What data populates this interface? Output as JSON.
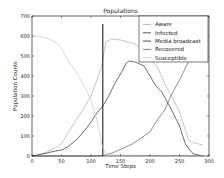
{
  "chart_data": {
    "type": "line",
    "title": "Populations",
    "xlabel": "Time Steps",
    "ylabel": "Population Counts",
    "xlim": [
      0,
      300
    ],
    "ylim": [
      0,
      700
    ],
    "xticks": [
      0,
      50,
      100,
      150,
      200,
      250,
      300
    ],
    "yticks": [
      0,
      100,
      200,
      300,
      400,
      500,
      600,
      700
    ],
    "grid": false,
    "legend_position": "upper right",
    "series": [
      {
        "name": "Aware",
        "color": "#b0b0b0",
        "x": [
          0,
          10,
          25,
          40,
          50,
          60,
          75,
          90,
          100,
          110,
          118,
          125,
          135,
          150,
          175,
          200,
          215,
          225,
          240,
          250,
          260,
          265,
          275,
          290
        ],
        "y": [
          0,
          5,
          20,
          40,
          60,
          110,
          180,
          250,
          300,
          380,
          450,
          570,
          585,
          580,
          560,
          500,
          430,
          360,
          280,
          220,
          130,
          80,
          65,
          55
        ]
      },
      {
        "name": "Infected",
        "color": "#303030",
        "x": [
          0,
          10,
          25,
          40,
          50,
          60,
          75,
          90,
          100,
          110,
          120,
          130,
          140,
          150,
          160,
          165,
          175,
          190,
          200,
          210,
          220,
          235,
          250,
          260,
          270,
          275,
          290
        ],
        "y": [
          0,
          5,
          15,
          25,
          30,
          45,
          80,
          130,
          170,
          215,
          250,
          300,
          360,
          410,
          465,
          475,
          470,
          450,
          400,
          350,
          320,
          240,
          150,
          60,
          20,
          10,
          0
        ]
      },
      {
        "name": "Media broadcast",
        "color": "#202020",
        "x": [
          120,
          120
        ],
        "y": [
          0,
          660
        ]
      },
      {
        "name": "Recovered",
        "color": "#606060",
        "x": [
          0,
          50,
          100,
          120,
          130,
          140,
          155,
          170,
          185,
          200,
          210,
          225,
          235,
          250,
          260,
          270
        ],
        "y": [
          0,
          0,
          0,
          2,
          10,
          20,
          40,
          60,
          90,
          120,
          170,
          230,
          300,
          380,
          440,
          500
        ]
      },
      {
        "name": "Susceptible",
        "color": "#c8c8c8",
        "x": [
          0,
          10,
          25,
          40,
          50,
          60,
          75,
          90,
          100,
          110,
          118,
          125,
          140,
          200,
          290
        ],
        "y": [
          600,
          598,
          590,
          570,
          540,
          480,
          420,
          340,
          280,
          180,
          60,
          10,
          5,
          3,
          2
        ]
      }
    ]
  }
}
